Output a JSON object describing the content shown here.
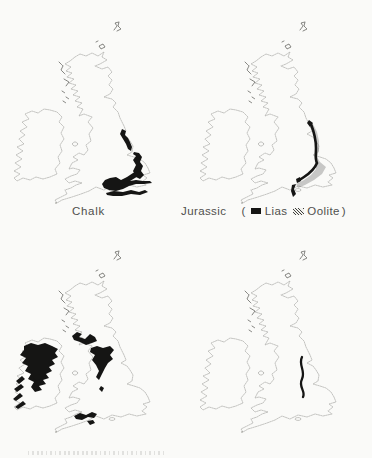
{
  "figure": {
    "background": "#fafaf8",
    "ink": "#151514",
    "coastline": "#979792",
    "caption_color": "#4f4f4d"
  },
  "maps": {
    "top_left": {
      "caption": "Chalk",
      "fill_style": "solid-black"
    },
    "top_right": {
      "caption": "Jurassic",
      "legend": {
        "open": "(",
        "lias": {
          "label": "Lias",
          "swatch": "solid-black-square"
        },
        "oolite": {
          "label": "Oolite",
          "swatch": "stippled-hatch-square"
        },
        "close": ")"
      }
    },
    "bottom_left": {
      "caption": "",
      "fill_style": "solid-black"
    },
    "bottom_right": {
      "caption": "",
      "fill_style": "single-dark-curved-line"
    }
  }
}
